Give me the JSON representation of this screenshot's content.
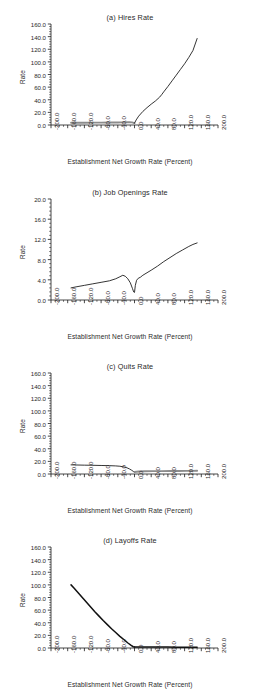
{
  "figure": {
    "panel_count": 4,
    "xlabel": "Establishment Net Growth Rate (Percent)",
    "ylabel": "Rate"
  },
  "chart_data": [
    {
      "type": "line",
      "title": "(a) Hires Rate",
      "xlabel": "Establishment Net Growth Rate (Percent)",
      "ylabel": "Rate",
      "xlim": [
        -200.0,
        200.0
      ],
      "ylim": [
        0.0,
        160.0
      ],
      "xticks": [
        "-200.0",
        "-160.0",
        "-120.0",
        "-80.0",
        "-40.0",
        "0.0",
        "40.0",
        "80.0",
        "120.0",
        "160.0",
        "200.0"
      ],
      "xtick_values": [
        -200,
        -160,
        -120,
        -80,
        -40,
        0,
        40,
        80,
        120,
        160,
        200
      ],
      "yticks": [
        "0.0",
        "20.0",
        "40.0",
        "60.0",
        "80.0",
        "100.0",
        "120.0",
        "140.0",
        "160.0"
      ],
      "ytick_values": [
        0,
        20,
        40,
        60,
        80,
        100,
        120,
        140,
        160
      ],
      "grid": false,
      "legend": "none",
      "series": [
        {
          "name": "Hires Rate",
          "style": "grey-flat",
          "x": [
            -152,
            -140,
            -120,
            -100,
            -80,
            -60,
            -40,
            -30,
            -20,
            -12,
            -6,
            0
          ],
          "y": [
            3.6,
            3.6,
            3.6,
            3.7,
            3.8,
            3.9,
            4.0,
            4.1,
            4.3,
            4.4,
            4.2,
            3.0
          ]
        },
        {
          "name": "Hires Rate",
          "style": "black",
          "x": [
            0,
            4,
            10,
            20,
            30,
            40,
            50,
            60,
            65,
            70,
            80,
            90,
            100,
            110,
            120,
            130,
            140,
            150
          ],
          "y": [
            3.0,
            8.0,
            14.0,
            21.5,
            27.5,
            33.0,
            38.0,
            44.0,
            48.0,
            52.5,
            61.0,
            70.0,
            79.0,
            88.0,
            97.0,
            107.0,
            118.0,
            137.0
          ]
        }
      ]
    },
    {
      "type": "line",
      "title": "(b) Job Openings Rate",
      "xlabel": "Establishment Net Growth Rate (Percent)",
      "ylabel": "Rate",
      "xlim": [
        -200.0,
        200.0
      ],
      "ylim": [
        0.0,
        20.0
      ],
      "xticks": [
        "-200.0",
        "-160.0",
        "-120.0",
        "-80.0",
        "-40.0",
        "0.0",
        "40.0",
        "80.0",
        "120.0",
        "160.0",
        "200.0"
      ],
      "xtick_values": [
        -200,
        -160,
        -120,
        -80,
        -40,
        0,
        40,
        80,
        120,
        160,
        200
      ],
      "yticks": [
        "0.0",
        "4.0",
        "8.0",
        "12.0",
        "16.0",
        "20.0"
      ],
      "ytick_values": [
        0,
        4,
        8,
        12,
        16,
        20
      ],
      "grid": false,
      "legend": "none",
      "series": [
        {
          "name": "Job Openings Rate",
          "style": "black",
          "x": [
            -152,
            -140,
            -120,
            -100,
            -80,
            -60,
            -45,
            -35,
            -28,
            -22,
            -16,
            -10,
            -5,
            -2,
            0,
            2,
            5,
            9,
            14,
            20,
            30,
            40,
            55,
            70,
            85,
            100,
            115,
            130,
            140,
            150
          ],
          "y": [
            2.4,
            2.6,
            2.9,
            3.2,
            3.5,
            3.8,
            4.2,
            4.6,
            4.9,
            4.7,
            4.2,
            3.4,
            2.3,
            1.6,
            1.5,
            2.9,
            3.9,
            4.3,
            4.5,
            4.9,
            5.4,
            5.9,
            6.7,
            7.6,
            8.4,
            9.2,
            9.9,
            10.6,
            11.0,
            11.3
          ]
        }
      ]
    },
    {
      "type": "line",
      "title": "(c) Quits Rate",
      "xlabel": "Establishment Net Growth Rate (Percent)",
      "ylabel": "Rate",
      "xlim": [
        -200.0,
        200.0
      ],
      "ylim": [
        0.0,
        160.0
      ],
      "xticks": [
        "-200.0",
        "-160.0",
        "-120.0",
        "-80.0",
        "-40.0",
        "0.0",
        "40.0",
        "80.0",
        "120.0",
        "160.0",
        "200.0"
      ],
      "xtick_values": [
        -200,
        -160,
        -120,
        -80,
        -40,
        0,
        40,
        80,
        120,
        160,
        200
      ],
      "yticks": [
        "0.0",
        "20.0",
        "40.0",
        "60.0",
        "80.0",
        "100.0",
        "120.0",
        "140.0",
        "160.0"
      ],
      "ytick_values": [
        0,
        20,
        40,
        60,
        80,
        100,
        120,
        140,
        160
      ],
      "grid": false,
      "legend": "none",
      "series": [
        {
          "name": "Quits Rate",
          "style": "black",
          "x": [
            -152,
            -140,
            -120,
            -100,
            -80,
            -60,
            -45,
            -35,
            -25,
            -18,
            -12,
            -7,
            -3,
            0
          ],
          "y": [
            14.5,
            14.3,
            14.0,
            13.8,
            13.5,
            13.2,
            12.8,
            12.3,
            11.2,
            9.8,
            8.0,
            6.0,
            4.2,
            3.2
          ]
        },
        {
          "name": "Quits Rate",
          "style": "grey-flat",
          "x": [
            0,
            10,
            25,
            45,
            65,
            85,
            105,
            125,
            140,
            150
          ],
          "y": [
            3.2,
            4.0,
            4.3,
            4.5,
            4.6,
            4.7,
            4.8,
            4.9,
            5.0,
            5.1
          ]
        }
      ]
    },
    {
      "type": "line",
      "title": "(d) Layoffs Rate",
      "xlabel": "Establishment Net Growth Rate (Percent)",
      "ylabel": "Rate",
      "xlim": [
        -200.0,
        200.0
      ],
      "ylim": [
        0.0,
        160.0
      ],
      "xticks": [
        "-200.0",
        "-160.0",
        "-120.0",
        "-80.0",
        "-40.0",
        "0.0",
        "40.0",
        "80.0",
        "120.0",
        "160.0",
        "200.0"
      ],
      "xtick_values": [
        -200,
        -160,
        -120,
        -80,
        -40,
        0,
        40,
        80,
        120,
        160,
        200
      ],
      "yticks": [
        "0.0",
        "20.0",
        "40.0",
        "60.0",
        "80.0",
        "100.0",
        "120.0",
        "140.0",
        "160.0"
      ],
      "ytick_values": [
        0,
        20,
        40,
        60,
        80,
        100,
        120,
        140,
        160
      ],
      "grid": false,
      "legend": "none",
      "series": [
        {
          "name": "Layoffs Rate",
          "style": "black-thick",
          "x": [
            -152,
            -145,
            -135,
            -125,
            -115,
            -105,
            -95,
            -85,
            -75,
            -65,
            -55,
            -45,
            -35,
            -25,
            -15,
            -8,
            -3,
            0
          ],
          "y": [
            100.0,
            95.0,
            87.5,
            80.0,
            72.5,
            65.0,
            57.5,
            50.5,
            43.5,
            37.0,
            30.5,
            24.5,
            18.5,
            13.0,
            7.5,
            4.0,
            2.0,
            1.6
          ]
        },
        {
          "name": "Layoffs Rate",
          "style": "black-thick",
          "x": [
            0,
            20,
            40,
            60,
            80,
            100,
            120,
            140,
            150
          ],
          "y": [
            1.6,
            1.5,
            1.5,
            1.4,
            1.4,
            1.3,
            1.3,
            1.2,
            1.2
          ]
        }
      ]
    }
  ]
}
